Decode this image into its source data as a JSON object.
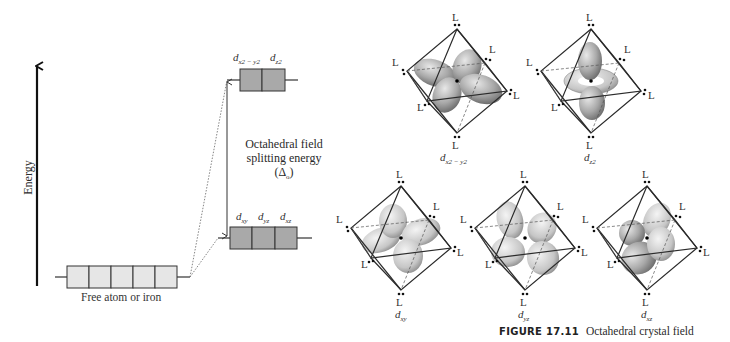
{
  "energy_diagram": {
    "axis_label": "Energy",
    "free_atom": {
      "label": "Free atom or iron",
      "orbital_count": 5,
      "fill": "#e6e6e6"
    },
    "eg": {
      "orbitals": [
        {
          "base": "d",
          "sub": "x2 − y2"
        },
        {
          "base": "d",
          "sub": "z2"
        }
      ],
      "fill": "#a9a9a9"
    },
    "t2g": {
      "orbitals": [
        {
          "base": "d",
          "sub": "xy"
        },
        {
          "base": "d",
          "sub": "yz"
        },
        {
          "base": "d",
          "sub": "xz"
        }
      ],
      "fill": "#a9a9a9"
    },
    "splitting": {
      "line1": "Octahedral field",
      "line2": "splitting energy",
      "symbol": "(Δ",
      "symbol_sub": "o",
      "symbol_close": ")"
    }
  },
  "orbital_panels": [
    {
      "id": "dx2-y2",
      "label_base": "d",
      "label_sub": "x2 − y2",
      "ligand": "L"
    },
    {
      "id": "dz2",
      "label_base": "d",
      "label_sub": "z2",
      "ligand": "L"
    },
    {
      "id": "dxy",
      "label_base": "d",
      "label_sub": "xy",
      "ligand": "L"
    },
    {
      "id": "dyz",
      "label_base": "d",
      "label_sub": "yz",
      "ligand": "L"
    },
    {
      "id": "dxz",
      "label_base": "d",
      "label_sub": "xz",
      "ligand": "L"
    }
  ],
  "figure": {
    "number": "FIGURE 17.11",
    "caption": "Octahedral crystal field"
  },
  "colors": {
    "line": "#2b2b2b",
    "lobe": "#9a9a9a",
    "lobe_light": "#d4d4d4",
    "box_dark": "#a9a9a9",
    "box_light": "#e6e6e6"
  }
}
